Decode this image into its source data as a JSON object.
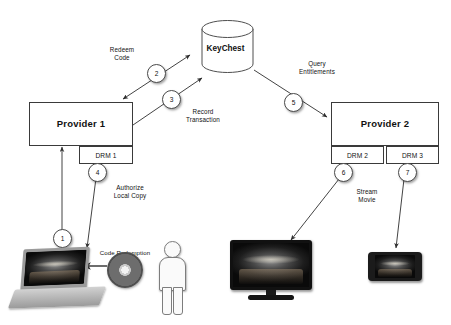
{
  "diagram": {
    "nodes": {
      "keychest": {
        "label": "KeyChest",
        "icon": "database-cylinder-icon"
      },
      "provider1": {
        "label": "Provider 1"
      },
      "provider2": {
        "label": "Provider 2"
      },
      "drm1": {
        "label": "DRM 1"
      },
      "drm2": {
        "label": "DRM 2"
      },
      "drm3": {
        "label": "DRM 3"
      }
    },
    "devices": {
      "laptop": {
        "name": "laptop-device",
        "screen_art": "movie-artwork"
      },
      "disc": {
        "name": "optical-disc",
        "caption": "Code Redemption"
      },
      "person": {
        "name": "person-figure"
      },
      "tv": {
        "name": "television-device",
        "screen_art": "movie-artwork"
      },
      "phone": {
        "name": "smartphone-device",
        "screen_art": "movie-artwork"
      }
    },
    "edge_labels": [
      {
        "id": "redeem-code",
        "text": "Redeem\nCode"
      },
      {
        "id": "record-transaction",
        "text": "Record\nTransaction"
      },
      {
        "id": "query-entitlements",
        "text": "Query\nEntitlements"
      },
      {
        "id": "authorize-local-copy",
        "text": "Authorize\nLocal Copy"
      },
      {
        "id": "stream-movie",
        "text": "Stream\nMovie"
      },
      {
        "id": "code-redemption",
        "text": "Code Redemption"
      }
    ],
    "steps": [
      {
        "number": "1",
        "from": "laptop",
        "to": "provider1"
      },
      {
        "number": "2",
        "from": "provider1",
        "to": "keychest"
      },
      {
        "number": "3",
        "from": "provider1",
        "to": "keychest"
      },
      {
        "number": "4",
        "from": "drm1",
        "to": "laptop"
      },
      {
        "number": "5",
        "from": "keychest",
        "to": "provider2"
      },
      {
        "number": "6",
        "from": "drm2",
        "to": "tv"
      },
      {
        "number": "7",
        "from": "drm3",
        "to": "phone"
      }
    ],
    "colors": {
      "stroke": "#3a3a3a",
      "background": "#ffffff",
      "text": "#111111"
    }
  }
}
